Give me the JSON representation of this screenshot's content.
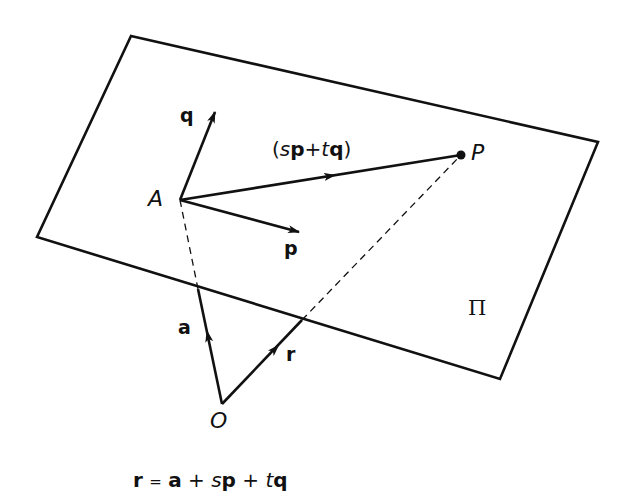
{
  "diagram": {
    "plane_label": "Π",
    "points": {
      "origin": "O",
      "point_on_plane": "A",
      "general_point": "P"
    },
    "vectors": {
      "a": "a",
      "r": "r",
      "p": "p",
      "q": "q",
      "combo_open": "(",
      "combo_s": "s",
      "combo_p": "p",
      "combo_plus": "+",
      "combo_t": "t",
      "combo_q": "q",
      "combo_close": ")"
    },
    "equation": {
      "r": "r",
      "eq": "=",
      "a": "a",
      "plus1": "+",
      "s": "s",
      "p": "p",
      "plus2": "+",
      "t": "t",
      "q": "q"
    },
    "colors": {
      "ink": "#111111",
      "background": "#ffffff"
    }
  }
}
